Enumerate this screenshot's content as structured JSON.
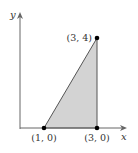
{
  "diagram": {
    "axes": {
      "x_label": "x",
      "y_label": "y"
    },
    "region": {
      "shape": "triangle",
      "fill": "#d0d0d0",
      "vertices": [
        "(1, 0)",
        "(3, 0)",
        "(3, 4)"
      ]
    },
    "points": [
      {
        "label": "(1, 0)",
        "x": 1,
        "y": 0
      },
      {
        "label": "(3, 0)",
        "x": 3,
        "y": 0
      },
      {
        "label": "(3, 4)",
        "x": 3,
        "y": 4
      }
    ],
    "colors": {
      "axis": "#666666",
      "edge": "#555555",
      "point": "#000000"
    }
  }
}
